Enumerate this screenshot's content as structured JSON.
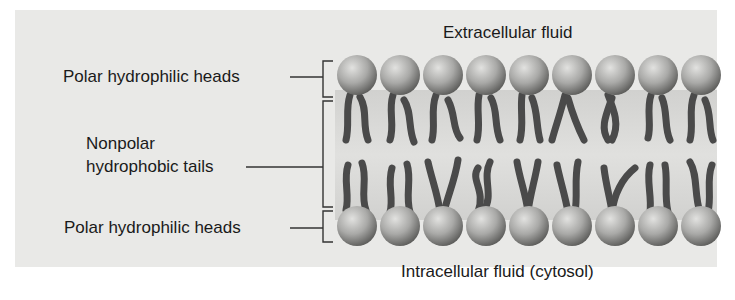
{
  "figure": {
    "type": "phospholipid-bilayer-diagram",
    "region_labels": {
      "top": "Extracellular fluid",
      "bottom": "Intracellular fluid (cytosol)"
    },
    "callouts": [
      {
        "id": "upper-heads",
        "label": "Polar hydrophilic heads"
      },
      {
        "id": "tails",
        "label_line1": "Nonpolar",
        "label_line2": "hydrophobic tails"
      },
      {
        "id": "lower-heads",
        "label": "Polar hydrophilic heads"
      }
    ],
    "heads_per_row": 9,
    "colors": {
      "background_panel": "#e9e9e7",
      "head_light": "#d6d6d4",
      "head_dark": "#6e6e6c",
      "tail": "#4a4a4a",
      "bracket": "#333333",
      "text": "#1a1a1a"
    }
  }
}
